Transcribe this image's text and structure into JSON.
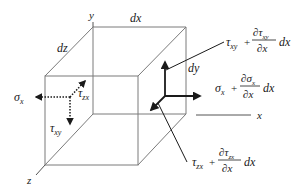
{
  "diagram": {
    "axes": {
      "x": "x",
      "y": "y",
      "z": "z"
    },
    "dimensions": {
      "dx": "dx",
      "dy": "dy",
      "dz": "dz"
    },
    "left_face": {
      "sigma": {
        "sym": "σ",
        "sub": "x"
      },
      "tau_zx": {
        "sym": "τ",
        "sub": "zx"
      },
      "tau_xy": {
        "sym": "τ",
        "sub": "xy"
      }
    },
    "right_face": {
      "tau_xy_expr": {
        "base": "τ",
        "base_sub": "xy",
        "plus": "+",
        "num": "∂τ",
        "num_sub": "xy",
        "den": "∂x",
        "tail": "dx"
      },
      "sigma_x_expr": {
        "base": "σ",
        "base_sub": "x",
        "plus": "+",
        "num": "∂σ",
        "num_sub": "x",
        "den": "∂x",
        "tail": "dx"
      },
      "tau_zx_expr": {
        "base": "τ",
        "base_sub": "zx",
        "plus": "+",
        "num": "∂τ",
        "num_sub": "zx",
        "den": "∂x",
        "tail": "dx"
      }
    },
    "colors": {
      "edge": "#7a7a7a",
      "arrow": "#1a1a1a",
      "text": "#1a1a1a"
    }
  }
}
